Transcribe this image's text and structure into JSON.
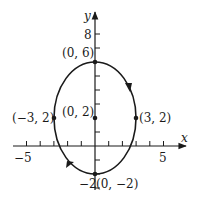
{
  "figure": {
    "type": "parametric-curve",
    "curve": "ellipse",
    "center": [
      0,
      2
    ],
    "semi_axis_x": 3,
    "semi_axis_y": 4,
    "orientation": "clockwise",
    "axes": {
      "x_label": "x",
      "y_label": "y",
      "x_ticks": [
        "−5",
        "5"
      ],
      "y_ticks": [
        "8",
        "−2"
      ]
    },
    "points": [
      {
        "label": "(0, 6)",
        "x": 0,
        "y": 6
      },
      {
        "label": "(0, 2)",
        "x": 0,
        "y": 2
      },
      {
        "label": "(−3, 2)",
        "x": -3,
        "y": 2
      },
      {
        "label": "(3, 2)",
        "x": 3,
        "y": 2
      },
      {
        "label": "(0, −2)",
        "x": 0,
        "y": -2
      }
    ],
    "colors": {
      "ink": "#1a1a1a",
      "background": "#ffffff"
    }
  }
}
